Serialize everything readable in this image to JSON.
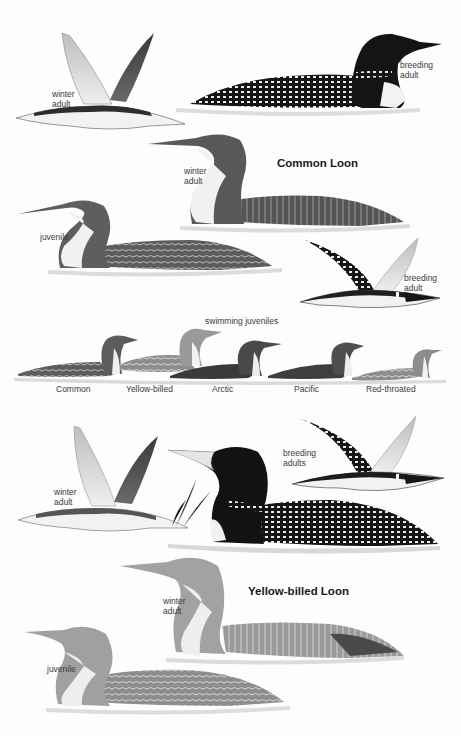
{
  "common_loon": {
    "title": "Common Loon",
    "labels": {
      "flying_winter": "winter\nadult",
      "swimming_breeding": "breeding\nadult",
      "swimming_winter": "winter\nadult",
      "juvenile": "juvenile",
      "flying_breeding": "breeding\nadult"
    }
  },
  "swimming_juveniles": {
    "heading": "swimming juveniles",
    "species": [
      "Common",
      "Yellow-billed",
      "Arctic",
      "Pacific",
      "Red-throated"
    ]
  },
  "yellow_billed_loon": {
    "title": "Yellow-billed Loon",
    "labels": {
      "flying_winter": "winter\nadult",
      "breeding_adults": "breeding\nadults",
      "swimming_winter": "winter\nadult",
      "juvenile": "juvenile"
    }
  },
  "colors": {
    "background": "#fdfdfd",
    "breeding_black": "#161616",
    "winter_gray": "#5a5a5a",
    "juvenile_gray": "#8a8a8a",
    "white_underparts": "#f4f4f4",
    "water": "#d9d9d9"
  }
}
